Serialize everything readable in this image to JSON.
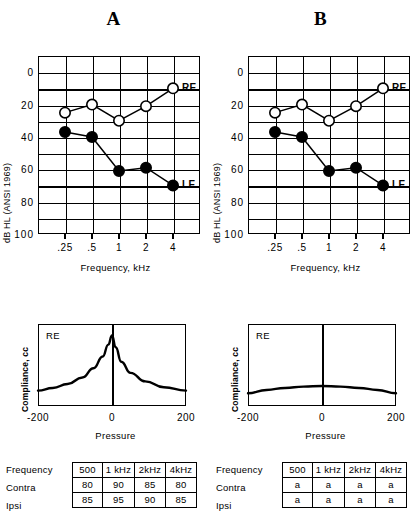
{
  "panels": [
    {
      "key": "A",
      "title": "A",
      "audiogram": {
        "ylabel": "dB HL (ANSI 1969)",
        "xlabel": "Frequency, kHz",
        "yticks": [
          "0",
          "20",
          "40",
          "60",
          "80",
          "100"
        ],
        "xticks": [
          ".25",
          ".5",
          "1",
          "2",
          "4"
        ],
        "re_label": "RE",
        "le_label": "LE"
      },
      "tympanogram": {
        "ylabel": "Compliance, cc",
        "xlabel": "Pressure",
        "ear": "RE",
        "xticks": [
          "-200",
          "0",
          "200"
        ],
        "shape": "peaked"
      },
      "table": {
        "row_labels": [
          "Frequency",
          "Contra",
          "Ipsi"
        ],
        "headers": [
          "500",
          "1 kHz",
          "2kHz",
          "4kHz"
        ],
        "contra": [
          "80",
          "90",
          "85",
          "80"
        ],
        "ipsi": [
          "85",
          "95",
          "90",
          "85"
        ]
      }
    },
    {
      "key": "B",
      "title": "B",
      "audiogram": {
        "ylabel": "dB HL (ANSI 1969)",
        "xlabel": "Frequency, kHz",
        "yticks": [
          "0",
          "20",
          "40",
          "60",
          "80",
          "100"
        ],
        "xticks": [
          ".25",
          ".5",
          "1",
          "2",
          "4"
        ],
        "re_label": "RE",
        "le_label": "LE"
      },
      "tympanogram": {
        "ylabel": "Compliance, cc",
        "xlabel": "Pressure",
        "ear": "RE",
        "xticks": [
          "-200",
          "0",
          "200"
        ],
        "shape": "flat"
      },
      "table": {
        "row_labels": [
          "Frequency",
          "Contra",
          "Ipsi"
        ],
        "headers": [
          "500",
          "1 kHz",
          "2kHz",
          "4kHz"
        ],
        "contra": [
          "a",
          "a",
          "a",
          "a"
        ],
        "ipsi": [
          "a",
          "a",
          "a",
          "a"
        ]
      }
    }
  ],
  "chart_data": [
    {
      "type": "line",
      "title": "A",
      "subtitle": "Pure-tone audiogram, panel A",
      "xlabel": "Frequency, kHz",
      "ylabel": "dB HL (ANSI 1969)",
      "categories": [
        ".25",
        ".5",
        "1",
        "2",
        "4"
      ],
      "x": [
        0.25,
        0.5,
        1,
        2,
        4
      ],
      "ylim": [
        -10,
        100
      ],
      "y_inverted": true,
      "yticks": [
        0,
        20,
        40,
        60,
        80,
        100
      ],
      "grid": true,
      "legend": "inline-right",
      "series": [
        {
          "name": "RE",
          "marker": "open-circle",
          "values": [
            25,
            20,
            30,
            21,
            10
          ]
        },
        {
          "name": "LE",
          "marker": "filled-circle",
          "values": [
            37,
            40,
            61,
            59,
            70
          ]
        }
      ]
    },
    {
      "type": "line",
      "title": "B",
      "subtitle": "Pure-tone audiogram, panel B",
      "xlabel": "Frequency, kHz",
      "ylabel": "dB HL (ANSI 1969)",
      "categories": [
        ".25",
        ".5",
        "1",
        "2",
        "4"
      ],
      "x": [
        0.25,
        0.5,
        1,
        2,
        4
      ],
      "ylim": [
        -10,
        100
      ],
      "y_inverted": true,
      "yticks": [
        0,
        20,
        40,
        60,
        80,
        100
      ],
      "grid": true,
      "legend": "inline-right",
      "series": [
        {
          "name": "RE",
          "marker": "open-circle",
          "values": [
            25,
            20,
            30,
            21,
            10
          ]
        },
        {
          "name": "LE",
          "marker": "filled-circle",
          "values": [
            37,
            40,
            61,
            59,
            70
          ]
        }
      ]
    },
    {
      "type": "line",
      "title": "Tympanogram A (RE)",
      "xlabel": "Pressure",
      "ylabel": "Compliance, cc",
      "xticks": [
        -200,
        0,
        200
      ],
      "xlim": [
        -200,
        200
      ],
      "grid": false,
      "shape": "peaked",
      "series": [
        {
          "name": "RE",
          "x": [
            -200,
            -160,
            -120,
            -80,
            -50,
            -25,
            -10,
            0,
            10,
            25,
            50,
            90,
            140,
            200
          ],
          "values": [
            0.16,
            0.2,
            0.26,
            0.36,
            0.5,
            0.68,
            0.86,
            1.0,
            0.82,
            0.6,
            0.43,
            0.3,
            0.21,
            0.16
          ]
        }
      ]
    },
    {
      "type": "line",
      "title": "Tympanogram B (RE)",
      "xlabel": "Pressure",
      "ylabel": "Compliance, cc",
      "xticks": [
        -200,
        0,
        200
      ],
      "xlim": [
        -200,
        200
      ],
      "grid": false,
      "shape": "flat",
      "series": [
        {
          "name": "RE",
          "x": [
            -200,
            -150,
            -100,
            -50,
            0,
            50,
            100,
            150,
            200
          ],
          "values": [
            0.12,
            0.17,
            0.2,
            0.22,
            0.23,
            0.22,
            0.2,
            0.17,
            0.12
          ]
        }
      ]
    },
    {
      "type": "table",
      "title": "Acoustic reflex thresholds, panel A",
      "columns": [
        "Frequency",
        "500",
        "1 kHz",
        "2kHz",
        "4kHz"
      ],
      "rows": [
        [
          "Contra",
          "80",
          "90",
          "85",
          "80"
        ],
        [
          "Ipsi",
          "85",
          "95",
          "90",
          "85"
        ]
      ]
    },
    {
      "type": "table",
      "title": "Acoustic reflex thresholds, panel B",
      "columns": [
        "Frequency",
        "500",
        "1 kHz",
        "2kHz",
        "4kHz"
      ],
      "rows": [
        [
          "Contra",
          "a",
          "a",
          "a",
          "a"
        ],
        [
          "Ipsi",
          "a",
          "a",
          "a",
          "a"
        ]
      ]
    }
  ]
}
